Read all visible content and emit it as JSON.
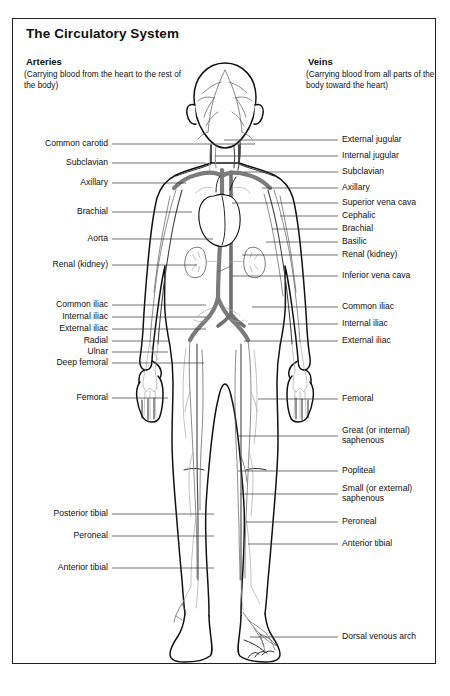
{
  "figure": {
    "title": "The Circulatory System",
    "border_color": "#222222"
  },
  "columns": {
    "arteries": {
      "heading": "Arteries",
      "subtitle": "(Carrying blood from the heart to the rest of the body)"
    },
    "veins": {
      "heading": "Veins",
      "subtitle": "(Carrying blood from all parts of the body toward the heart)"
    }
  },
  "left_labels": [
    {
      "text": "Common carotid",
      "y": 144,
      "tx": 255
    },
    {
      "text": "Subclavian",
      "y": 163,
      "tx": 206
    },
    {
      "text": "Axillary",
      "y": 183,
      "tx": 186
    },
    {
      "text": "Brachial",
      "y": 212,
      "tx": 192
    },
    {
      "text": "Aorta",
      "y": 239,
      "tx": 213
    },
    {
      "text": "Renal (kidney)",
      "y": 265,
      "tx": 197
    },
    {
      "text": "Common iliac",
      "y": 305,
      "tx": 206
    },
    {
      "text": "Internal iliac",
      "y": 317,
      "tx": 206
    },
    {
      "text": "External iliac",
      "y": 329,
      "tx": 206
    },
    {
      "text": "Radial",
      "y": 341,
      "tx": 168
    },
    {
      "text": "Ulnar",
      "y": 352,
      "tx": 168
    },
    {
      "text": "Deep femoral",
      "y": 363,
      "tx": 204
    },
    {
      "text": "Femoral",
      "y": 398,
      "tx": 168
    },
    {
      "text": "Posterior tibial",
      "y": 514,
      "tx": 214
    },
    {
      "text": "Peroneal",
      "y": 536,
      "tx": 214
    },
    {
      "text": "Anterior tibial",
      "y": 568,
      "tx": 214
    }
  ],
  "right_labels": [
    {
      "text": "External jugular",
      "y": 140,
      "tx": 224
    },
    {
      "text": "Internal jugular",
      "y": 156,
      "tx": 215
    },
    {
      "text": "Subclavian",
      "y": 172,
      "tx": 244
    },
    {
      "text": "Axillary",
      "y": 188,
      "tx": 262
    },
    {
      "text": "Superior vena cava",
      "y": 203,
      "tx": 232
    },
    {
      "text": "Cephalic",
      "y": 216,
      "tx": 280
    },
    {
      "text": "Brachial",
      "y": 229,
      "tx": 272
    },
    {
      "text": "Basilic",
      "y": 242,
      "tx": 266
    },
    {
      "text": "Renal (kidney)",
      "y": 255,
      "tx": 242
    },
    {
      "text": "Inferior vena cava",
      "y": 276,
      "tx": 232
    },
    {
      "text": "Common iliac",
      "y": 307,
      "tx": 252
    },
    {
      "text": "Internal iliac",
      "y": 324,
      "tx": 248
    },
    {
      "text": "External iliac",
      "y": 341,
      "tx": 244
    },
    {
      "text": "Femoral",
      "y": 399,
      "tx": 258
    },
    {
      "text": "Great (or internal) saphenous",
      "y": 436,
      "tx": 238,
      "two": true
    },
    {
      "text": "Popliteal",
      "y": 471,
      "tx": 238
    },
    {
      "text": "Small (or external) saphenous",
      "y": 494,
      "tx": 240,
      "two": true
    },
    {
      "text": "Peroneal",
      "y": 522,
      "tx": 246
    },
    {
      "text": "Anterior tibial",
      "y": 544,
      "tx": 248
    },
    {
      "text": "Dorsal venous arch",
      "y": 637,
      "tx": 250
    }
  ]
}
